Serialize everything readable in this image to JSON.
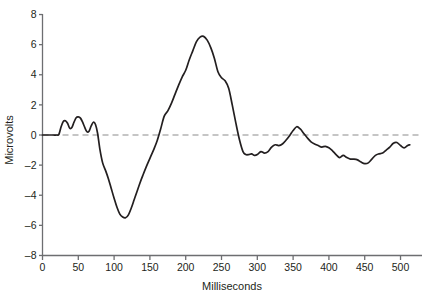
{
  "chart_data": {
    "type": "line",
    "title": "",
    "subtitle": "",
    "xlabel": "Milliseconds",
    "ylabel": "Microvolts",
    "xlim": [
      0,
      530
    ],
    "ylim": [
      -8,
      8
    ],
    "grid": false,
    "legend": null,
    "xticks": [
      0,
      50,
      100,
      150,
      200,
      250,
      300,
      350,
      400,
      450,
      500
    ],
    "xtick_labels": [
      "0",
      "50",
      "100",
      "150",
      "200",
      "250",
      "300",
      "350",
      "400",
      "450",
      "500"
    ],
    "yticks": [
      8,
      6,
      4,
      2,
      0,
      -2,
      -4,
      -6,
      -8
    ],
    "ytick_labels": [
      "8",
      "6",
      "4",
      "2",
      "0",
      "–2",
      "–4",
      "–6",
      "–8"
    ],
    "annotations": [
      {
        "label": "zero-reference-line",
        "y": 0,
        "style": "dashed"
      }
    ],
    "line_color": "#231f20",
    "zero_line_color": "#8c8c8c",
    "axis_color": "#6d6e71",
    "series": [
      {
        "name": "ERP waveform",
        "x": [
          0,
          5,
          10,
          15,
          20,
          23,
          26,
          29,
          32,
          35,
          38,
          41,
          44,
          47,
          50,
          53,
          56,
          59,
          62,
          65,
          68,
          71,
          74,
          77,
          80,
          84,
          88,
          92,
          96,
          100,
          104,
          108,
          112,
          116,
          120,
          124,
          128,
          132,
          136,
          140,
          145,
          150,
          155,
          160,
          165,
          170,
          175,
          180,
          185,
          190,
          195,
          200,
          205,
          210,
          215,
          220,
          225,
          230,
          235,
          240,
          245,
          250,
          255,
          260,
          265,
          270,
          275,
          280,
          284,
          288,
          292,
          296,
          300,
          305,
          310,
          315,
          320,
          325,
          330,
          335,
          340,
          345,
          350,
          355,
          360,
          365,
          370,
          375,
          380,
          385,
          390,
          395,
          400,
          405,
          410,
          415,
          420,
          425,
          430,
          435,
          440,
          445,
          450,
          455,
          460,
          465,
          470,
          475,
          480,
          485,
          490,
          495,
          500,
          505,
          510,
          513
        ],
        "y": [
          0,
          0,
          0,
          0,
          0,
          0.05,
          0.55,
          0.9,
          0.95,
          0.78,
          0.45,
          0.5,
          0.85,
          1.15,
          1.2,
          1.12,
          0.85,
          0.5,
          0.22,
          0.25,
          0.6,
          0.85,
          0.7,
          0.1,
          -0.9,
          -1.85,
          -2.35,
          -2.9,
          -3.55,
          -4.2,
          -4.8,
          -5.25,
          -5.45,
          -5.5,
          -5.3,
          -4.85,
          -4.3,
          -3.75,
          -3.2,
          -2.7,
          -2.1,
          -1.55,
          -1.0,
          -0.4,
          0.4,
          1.25,
          1.6,
          2.1,
          2.7,
          3.3,
          3.85,
          4.3,
          5.0,
          5.6,
          6.2,
          6.5,
          6.55,
          6.3,
          5.8,
          5.1,
          4.2,
          3.8,
          3.6,
          3.1,
          2.0,
          0.8,
          -0.3,
          -1.1,
          -1.3,
          -1.3,
          -1.25,
          -1.35,
          -1.3,
          -1.1,
          -1.2,
          -1.1,
          -0.8,
          -0.65,
          -0.7,
          -0.6,
          -0.35,
          -0.05,
          0.3,
          0.55,
          0.4,
          0.1,
          -0.2,
          -0.45,
          -0.6,
          -0.7,
          -0.8,
          -0.75,
          -0.85,
          -1.05,
          -1.3,
          -1.5,
          -1.35,
          -1.5,
          -1.6,
          -1.6,
          -1.65,
          -1.8,
          -1.9,
          -1.85,
          -1.6,
          -1.35,
          -1.25,
          -1.2,
          -1.0,
          -0.8,
          -0.55,
          -0.5,
          -0.7,
          -0.85,
          -0.7,
          -0.65
        ]
      }
    ]
  },
  "axis": {
    "x_title": "Milliseconds",
    "y_title": "Microvolts"
  }
}
